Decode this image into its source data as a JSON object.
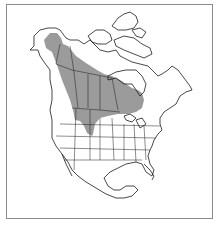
{
  "map": {
    "title": "",
    "region": "North America",
    "range_fill_color": "#9b9b9b",
    "border_color": "#8c8c8c",
    "outline_color": "#1a1a1a",
    "legend": []
  }
}
